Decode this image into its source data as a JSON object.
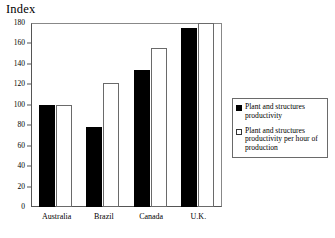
{
  "chart_data": {
    "type": "bar",
    "title": "",
    "ylabel": "Index",
    "xlabel": "",
    "ylim": [
      0,
      180
    ],
    "yticks": [
      0,
      20,
      40,
      60,
      80,
      100,
      120,
      140,
      160,
      180
    ],
    "grid": false,
    "legend_position": "right",
    "categories": [
      "Australia",
      "Brazil",
      "Canada",
      "U.K."
    ],
    "series": [
      {
        "name": "Plant and structures productivity",
        "color": "#000000",
        "values": [
          100,
          78,
          134,
          175
        ]
      },
      {
        "name": "Plant and structures productivity per hour of production",
        "color": "#ffffff",
        "values": [
          100,
          121,
          156,
          180
        ]
      }
    ]
  },
  "axis": {
    "y_title": "Index",
    "tick_labels": [
      "180",
      "160",
      "140",
      "120",
      "100",
      "80",
      "60",
      "40",
      "20",
      "0"
    ],
    "category_labels": [
      "Australia",
      "Brazil",
      "Canada",
      "U.K."
    ]
  },
  "legend": {
    "entries": [
      {
        "swatch": "filled-square-black",
        "label": "Plant and structures productivity"
      },
      {
        "swatch": "open-square-white",
        "label": "Plant and structures productivity per hour of production"
      }
    ]
  }
}
